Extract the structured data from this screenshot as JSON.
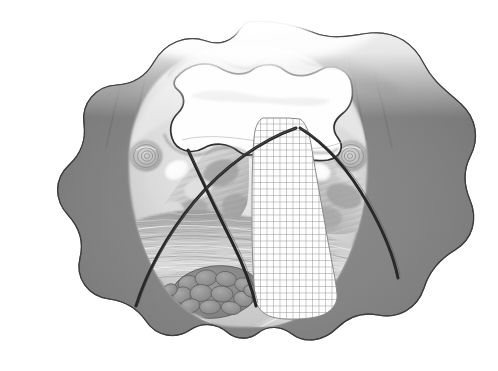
{
  "figure": {
    "caption": "",
    "style": "grayscale pencil / airbrush medical illustration",
    "canvas": {
      "width": 498,
      "height": 371,
      "background": "#ffffff"
    },
    "palette": {
      "background": "#ffffff",
      "outer_tissue": "#828282",
      "outer_tissue_dark": "#6e6e6e",
      "outline": "#3a3a3a",
      "mid_tissue": "#b4b4b4",
      "light_tissue": "#d6d6d6",
      "pale_tissue": "#e8e8e8",
      "highlight": "#ffffff",
      "lumen": "#ffffff",
      "suture_dark": "#2b2b2b",
      "grid_line": "#8a8a8a",
      "lobule_fill": "#8f8f8f",
      "lobule_edge": "#5e5e5e"
    },
    "structures": [
      {
        "name": "outer-tissue-mass",
        "label": "Outer tissue mass (lobed silhouette)",
        "tone": "#828282"
      },
      {
        "name": "central-lumen",
        "label": "Central lumen / airway (bowtie shaped cavity)",
        "tone": "#ffffff"
      },
      {
        "name": "left-vessel-cross-section",
        "label": "Left vessel in cross-section (concentric rings)",
        "tone": "#c4c4c4"
      },
      {
        "name": "right-vessel-cross-section",
        "label": "Right vessel in cross-section (concentric rings)",
        "tone": "#c4c4c4"
      },
      {
        "name": "left-highlight-oval",
        "label": "Left bright oval inclusion",
        "tone": "#ffffff"
      },
      {
        "name": "right-highlight-oval",
        "label": "Right bright oval inclusion",
        "tone": "#ffffff"
      },
      {
        "name": "lobulated-gland",
        "label": "Lobulated glandular cluster (lower left of midline)",
        "tone": "#8f8f8f"
      },
      {
        "name": "striated-muscle-band",
        "label": "Striated muscle / fibrous band across midline",
        "tone": "#b8b8b8"
      },
      {
        "name": "hatched-overlay-region",
        "label": "Cross-hatched grid overlay region (teardrop field)",
        "tone": "#ffffff"
      },
      {
        "name": "suture-line-left-outer",
        "label": "Dark curved line, left outer (instrument / suture)",
        "tone": "#2b2b2b"
      },
      {
        "name": "suture-line-left-inner",
        "label": "Dark curved line, left inner (instrument / suture)",
        "tone": "#2b2b2b"
      },
      {
        "name": "suture-line-right",
        "label": "Dark curved line, right (instrument / suture)",
        "tone": "#2b2b2b"
      },
      {
        "name": "bottom-striated-layers",
        "label": "Wavy striated layers along inferior border",
        "tone": "#c8c8c8"
      }
    ],
    "hatch_overlay": {
      "name": "grid-overlay",
      "spacing_px": 6.5,
      "line_width_px": 0.9,
      "line_color": "#8a8a8a",
      "cell_color": "#ffffff",
      "bounds": {
        "x": 252,
        "y": 118,
        "width": 118,
        "height": 202
      }
    }
  }
}
